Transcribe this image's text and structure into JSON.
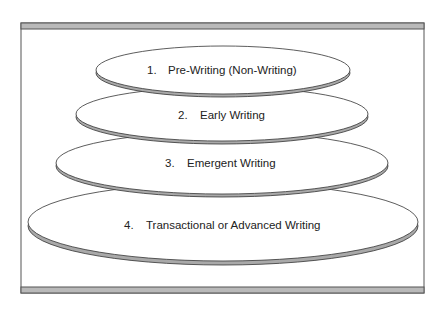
{
  "diagram": {
    "type": "stacked-ellipse-stages",
    "stages": [
      {
        "number": "1.",
        "label": "Pre-Writing (Non-Writing)"
      },
      {
        "number": "2.",
        "label": "Early Writing"
      },
      {
        "number": "3.",
        "label": "Emergent Writing"
      },
      {
        "number": "4.",
        "label": "Transactional or Advanced Writing"
      }
    ],
    "colors": {
      "frame_bar": "#b9b9b9",
      "outline": "#333333",
      "shadow": "#a9a9a9",
      "fill": "#ffffff"
    }
  }
}
